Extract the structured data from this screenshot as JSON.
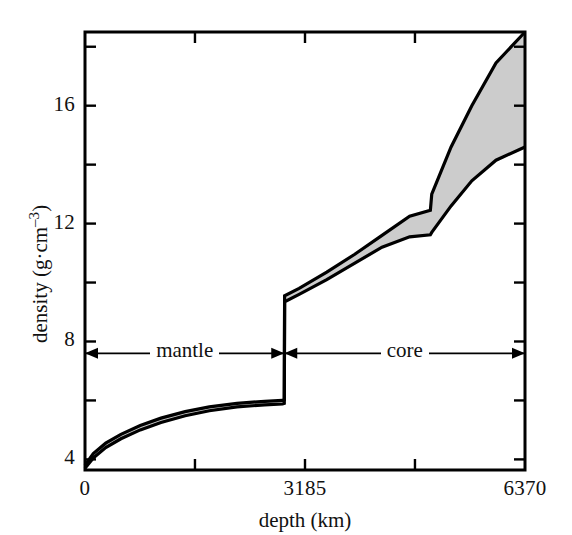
{
  "chart_data": {
    "type": "area",
    "title": "",
    "subtitle": "",
    "xlabel": "depth (km)",
    "ylabel_plain": "density (g·cm–3)",
    "ylabel_base": "density (g·cm",
    "ylabel_exponent": "–3",
    "ylabel_close": ")",
    "xlim": [
      0,
      6370
    ],
    "ylim": [
      3.64,
      18.5
    ],
    "x_ticks_labeled": [
      {
        "value": 0,
        "label": "0"
      },
      {
        "value": 3185,
        "label": "3185"
      },
      {
        "value": 6370,
        "label": "6370"
      }
    ],
    "x_ticks_minor": [
      1592,
      4777
    ],
    "y_ticks_labeled": [
      {
        "value": 4,
        "label": "4"
      },
      {
        "value": 8,
        "label": "8"
      },
      {
        "value": 12,
        "label": "12"
      },
      {
        "value": 16,
        "label": "16"
      }
    ],
    "y_ticks_minor": [
      6,
      10,
      14,
      18
    ],
    "grid": false,
    "legend": null,
    "fill_color": "#cccccc",
    "line_color": "#000000",
    "annotations": [
      {
        "name": "mantle",
        "label": "mantle",
        "x_start": 0,
        "x_end": 2885,
        "y": 7.6,
        "arrow": "double"
      },
      {
        "name": "core",
        "label": "core",
        "x_start": 2885,
        "x_end": 6370,
        "y": 7.6,
        "arrow": "double"
      }
    ],
    "series": [
      {
        "name": "upper bound density",
        "points": [
          [
            0,
            3.8
          ],
          [
            120,
            4.2
          ],
          [
            300,
            4.55
          ],
          [
            520,
            4.85
          ],
          [
            800,
            5.15
          ],
          [
            1100,
            5.4
          ],
          [
            1450,
            5.62
          ],
          [
            1800,
            5.78
          ],
          [
            2200,
            5.9
          ],
          [
            2600,
            5.97
          ],
          [
            2860,
            6.0
          ],
          [
            2885,
            6.02
          ],
          [
            2890,
            9.55
          ],
          [
            3100,
            9.8
          ],
          [
            3500,
            10.35
          ],
          [
            3900,
            10.95
          ],
          [
            4300,
            11.6
          ],
          [
            4700,
            12.25
          ],
          [
            5000,
            12.45
          ],
          [
            5020,
            13.0
          ],
          [
            5300,
            14.6
          ],
          [
            5600,
            16.0
          ],
          [
            5950,
            17.45
          ],
          [
            6370,
            18.5
          ]
        ]
      },
      {
        "name": "lower bound density",
        "points": [
          [
            0,
            3.7
          ],
          [
            120,
            4.05
          ],
          [
            300,
            4.4
          ],
          [
            520,
            4.7
          ],
          [
            800,
            5.0
          ],
          [
            1100,
            5.25
          ],
          [
            1450,
            5.48
          ],
          [
            1800,
            5.65
          ],
          [
            2200,
            5.78
          ],
          [
            2600,
            5.85
          ],
          [
            2860,
            5.88
          ],
          [
            2885,
            5.9
          ],
          [
            2890,
            9.35
          ],
          [
            3100,
            9.6
          ],
          [
            3500,
            10.1
          ],
          [
            3900,
            10.65
          ],
          [
            4300,
            11.2
          ],
          [
            4700,
            11.55
          ],
          [
            5000,
            11.62
          ],
          [
            5020,
            11.7
          ],
          [
            5300,
            12.6
          ],
          [
            5600,
            13.45
          ],
          [
            5950,
            14.15
          ],
          [
            6370,
            14.6
          ]
        ]
      }
    ]
  },
  "axes_box": {
    "left_px": 85,
    "right_px": 525,
    "top_px": 32,
    "bottom_px": 470
  }
}
